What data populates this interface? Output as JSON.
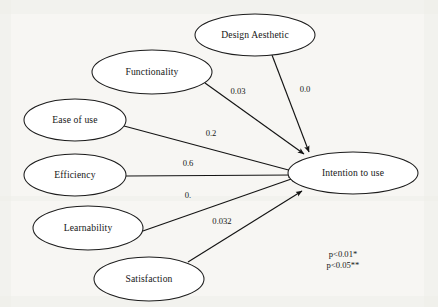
{
  "diagram": {
    "type": "path-model",
    "title_visible": false,
    "target_node": "Intention to use",
    "nodes": [
      {
        "id": "design_aesthetic",
        "label": "Design Aesthetic",
        "cx": 255,
        "cy": 35,
        "rx": 60,
        "ry": 21
      },
      {
        "id": "functionality",
        "label": "Functionality",
        "cx": 152,
        "cy": 72,
        "rx": 60,
        "ry": 22
      },
      {
        "id": "ease_of_use",
        "label": "Ease of use",
        "cx": 75,
        "cy": 120,
        "rx": 51,
        "ry": 21
      },
      {
        "id": "efficiency",
        "label": "Efficiency",
        "cx": 75,
        "cy": 175,
        "rx": 51,
        "ry": 21
      },
      {
        "id": "learnability",
        "label": "Learnability",
        "cx": 88,
        "cy": 228,
        "rx": 55,
        "ry": 22
      },
      {
        "id": "satisfaction",
        "label": "Satisfaction",
        "cx": 149,
        "cy": 279,
        "rx": 55,
        "ry": 22
      },
      {
        "id": "intention_to_use",
        "label": "Intention to use",
        "cx": 353,
        "cy": 173,
        "rx": 65,
        "ry": 21
      }
    ],
    "edges": [
      {
        "id": "e-functionality",
        "from": "functionality",
        "to": "intention_to_use",
        "label": "0.03",
        "label_x": 238,
        "label_y": 92,
        "x1": 205,
        "y1": 83,
        "x2": 304,
        "y2": 154
      },
      {
        "id": "e-design-aesthetic",
        "from": "design_aesthetic",
        "to": "intention_to_use",
        "label": "0.0",
        "label_x": 305,
        "label_y": 90,
        "x1": 272,
        "y1": 55,
        "x2": 309,
        "y2": 152
      },
      {
        "id": "e-ease-of-use",
        "from": "ease_of_use",
        "to": "intention_to_use",
        "label": "0.2",
        "label_x": 211,
        "label_y": 134,
        "x1": 124,
        "y1": 126,
        "x2": 296,
        "y2": 172
      },
      {
        "id": "e-efficiency",
        "from": "efficiency",
        "to": "intention_to_use",
        "label": "0.6",
        "label_x": 188,
        "label_y": 164,
        "x1": 126,
        "y1": 176,
        "x2": 294,
        "y2": 175
      },
      {
        "id": "e-learnability",
        "from": "learnability",
        "to": "intention_to_use",
        "label": "0.",
        "label_x": 188,
        "label_y": 196,
        "x1": 140,
        "y1": 232,
        "x2": 297,
        "y2": 177
      },
      {
        "id": "e-satisfaction",
        "from": "satisfaction",
        "to": "intention_to_use",
        "label": "0.032",
        "label_x": 222,
        "label_y": 222,
        "x1": 188,
        "y1": 262,
        "x2": 302,
        "y2": 191
      }
    ],
    "legend": {
      "id": "significance-legend",
      "lines": [
        "p<0.01*",
        "p<0.05**"
      ],
      "x": 343,
      "y": 255
    },
    "colors": {
      "stroke": "#141414",
      "node_fill": "#ffffff",
      "text": "#161616",
      "background": "#fbfbfa"
    }
  }
}
